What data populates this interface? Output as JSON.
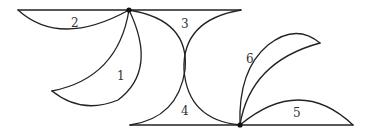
{
  "diagram": {
    "type": "geometric-figure",
    "colors": {
      "stroke": "#222222",
      "point": "#111111",
      "label": "#333333"
    },
    "points": [
      {
        "id": "top-point",
        "x": 129,
        "y": 10
      },
      {
        "id": "bottom-point",
        "x": 240,
        "y": 125
      }
    ],
    "lines": [
      {
        "id": "top-line",
        "x1": 18,
        "y1": 10,
        "x2": 241,
        "y2": 10
      },
      {
        "id": "bottom-line",
        "x1": 130,
        "y1": 125,
        "x2": 353,
        "y2": 125
      }
    ],
    "regions": [
      {
        "id": "region-1",
        "label": "1"
      },
      {
        "id": "region-2",
        "label": "2"
      },
      {
        "id": "region-3",
        "label": "3"
      },
      {
        "id": "region-4",
        "label": "4"
      },
      {
        "id": "region-5",
        "label": "5"
      },
      {
        "id": "region-6",
        "label": "6"
      }
    ]
  }
}
